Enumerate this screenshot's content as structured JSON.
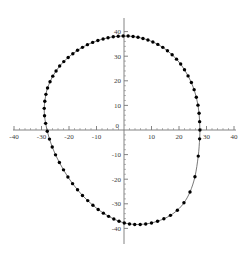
{
  "chart_data": {
    "type": "scatter",
    "title": "",
    "subtitle": "",
    "xlabel": "",
    "ylabel": "",
    "xlim": [
      -40,
      40
    ],
    "ylim": [
      -40,
      40
    ],
    "grid": false,
    "legend": null,
    "legend_position": "none",
    "axis_style": "crossed-axes-through-origin",
    "x_ticks_major": [
      -40,
      -30,
      -20,
      -10,
      0,
      10,
      20,
      30,
      40
    ],
    "x_tick_labels": [
      "-40",
      "-30",
      "-20",
      "-10",
      "0",
      "10",
      "20",
      "30",
      "40"
    ],
    "y_ticks_major": [
      -40,
      -30,
      -20,
      -10,
      0,
      10,
      20,
      30,
      40
    ],
    "y_tick_labels": [
      "-40",
      "-30",
      "-20",
      "-10",
      "0",
      "10",
      "20",
      "30",
      "40"
    ],
    "x_tick_minor_step": 2,
    "y_tick_minor_step": 2,
    "marker": "filled-circle",
    "marker_color": "#000000",
    "line_color": "#555555",
    "n_points": 72,
    "closed_curve": true,
    "x_extent": [
      -29.0,
      27.6
    ],
    "y_extent": [
      -38.4,
      38.2
    ],
    "series": [
      {
        "name": "curve",
        "x": [
          27.6,
          27.5,
          27.3,
          26.9,
          26.3,
          25.5,
          24.5,
          23.3,
          22.0,
          20.6,
          19.1,
          17.5,
          15.8,
          14.1,
          12.3,
          10.5,
          8.7,
          6.9,
          5.1,
          3.3,
          1.5,
          -0.3,
          -2.1,
          -3.9,
          -5.8,
          -7.6,
          -9.5,
          -11.4,
          -13.3,
          -15.1,
          -16.9,
          -18.6,
          -20.3,
          -21.9,
          -23.4,
          -24.7,
          -25.9,
          -26.9,
          -27.8,
          -28.4,
          -28.8,
          -29.0,
          -28.9,
          -28.5,
          -27.9,
          -27.1,
          -26.1,
          -24.9,
          -23.5,
          -22.0,
          -20.4,
          -18.7,
          -16.9,
          -15.1,
          -13.2,
          -11.3,
          -9.4,
          -7.5,
          -5.6,
          -3.7,
          -1.8,
          0.1,
          2.0,
          3.9,
          5.9,
          7.9,
          10.0,
          12.2,
          14.5,
          16.9,
          19.4,
          21.8,
          24.0,
          25.8,
          27.0,
          27.5
        ],
        "y": [
          0.0,
          3.4,
          6.8,
          10.1,
          13.3,
          16.4,
          19.3,
          22.0,
          24.5,
          26.8,
          28.8,
          30.6,
          32.2,
          33.6,
          34.8,
          35.8,
          36.6,
          37.2,
          37.7,
          38.0,
          38.2,
          38.2,
          38.1,
          37.9,
          37.5,
          37.0,
          36.4,
          35.6,
          34.7,
          33.6,
          32.4,
          31.0,
          29.5,
          27.8,
          26.0,
          24.0,
          21.9,
          19.6,
          17.1,
          14.5,
          11.7,
          8.8,
          5.8,
          2.7,
          -0.5,
          -3.7,
          -6.9,
          -10.1,
          -13.2,
          -16.2,
          -19.1,
          -21.8,
          -24.3,
          -26.6,
          -28.7,
          -30.6,
          -32.3,
          -33.8,
          -35.1,
          -36.2,
          -37.1,
          -37.8,
          -38.2,
          -38.4,
          -38.4,
          -38.2,
          -37.8,
          -37.1,
          -36.1,
          -34.7,
          -32.6,
          -29.6,
          -25.2,
          -19.0,
          -10.6,
          -3.6
        ]
      }
    ]
  },
  "plot_geometry": {
    "origin_x_px": 124,
    "origin_y_px": 130,
    "px_per_unit_x": 2.75,
    "px_per_unit_y": 2.46,
    "axis_x_start_px": 13,
    "axis_x_end_px": 236,
    "axis_y_start_px": 18,
    "axis_y_end_px": 244,
    "major_tick_len_px": 4,
    "minor_tick_len_px": 2,
    "marker_radius_px": 1.7
  }
}
